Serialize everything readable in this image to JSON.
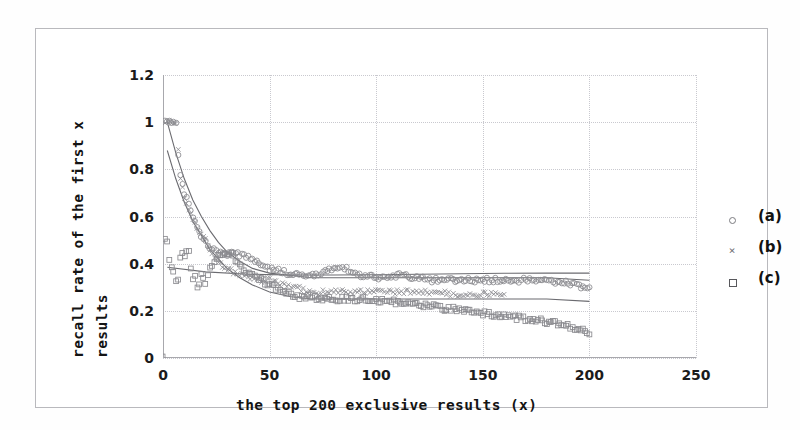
{
  "chart_data": {
    "type": "scatter",
    "title": "",
    "xlabel": "the top 200 exclusive results (x)",
    "ylabel_line1": "recall rate of the first x",
    "ylabel_line2": "results",
    "xlim": [
      0,
      250
    ],
    "ylim": [
      0,
      1.2
    ],
    "xticks": [
      "0",
      "50",
      "100",
      "150",
      "200",
      "250"
    ],
    "xtick_values": [
      0,
      50,
      100,
      150,
      200,
      250
    ],
    "yticks": [
      "0",
      "0.2",
      "0.4",
      "0.6",
      "0.8",
      "1",
      "1.2"
    ],
    "ytick_values": [
      0,
      0.2,
      0.4,
      0.6,
      0.8,
      1,
      1.2
    ],
    "grid": true,
    "grid_style": "dotted",
    "legend_position": "right-outside",
    "marker_color": "#8a8a8f",
    "fit_curve_color": "#6b6b70",
    "legend": [
      {
        "label": "(a)",
        "marker": "circle-marker"
      },
      {
        "label": "(b)",
        "marker": "cross-marker"
      },
      {
        "label": "(c)",
        "marker": "square-marker"
      }
    ],
    "series": [
      {
        "name": "(a)",
        "marker": "circle",
        "x": [
          1,
          2,
          3,
          4,
          5,
          6,
          7,
          8,
          9,
          10,
          12,
          14,
          16,
          18,
          20,
          22,
          24,
          26,
          28,
          30,
          32,
          34,
          36,
          38,
          40,
          42,
          44,
          46,
          48,
          50,
          54,
          58,
          62,
          66,
          70,
          74,
          78,
          82,
          86,
          90,
          94,
          98,
          102,
          106,
          110,
          114,
          118,
          122,
          126,
          130,
          134,
          138,
          142,
          146,
          150,
          154,
          158,
          162,
          166,
          170,
          174,
          178,
          182,
          186,
          190,
          194,
          198,
          200
        ],
        "y": [
          1.0,
          1.0,
          1.0,
          1.0,
          1.0,
          1.0,
          0.86,
          0.78,
          0.74,
          0.7,
          0.66,
          0.6,
          0.56,
          0.52,
          0.49,
          0.47,
          0.46,
          0.45,
          0.44,
          0.44,
          0.45,
          0.45,
          0.44,
          0.43,
          0.43,
          0.42,
          0.41,
          0.4,
          0.39,
          0.38,
          0.37,
          0.36,
          0.36,
          0.35,
          0.35,
          0.36,
          0.37,
          0.39,
          0.38,
          0.36,
          0.35,
          0.35,
          0.34,
          0.34,
          0.35,
          0.35,
          0.34,
          0.34,
          0.33,
          0.33,
          0.33,
          0.33,
          0.33,
          0.33,
          0.33,
          0.33,
          0.33,
          0.33,
          0.33,
          0.33,
          0.33,
          0.33,
          0.33,
          0.32,
          0.32,
          0.31,
          0.3,
          0.3
        ]
      },
      {
        "name": "(b)",
        "marker": "cross",
        "x": [
          1,
          2,
          3,
          4,
          5,
          6,
          8,
          10,
          12,
          14,
          16,
          18,
          20,
          22,
          24,
          26,
          28,
          30,
          34,
          38,
          42,
          46,
          50,
          54,
          58,
          62,
          66,
          70,
          74,
          78,
          82,
          86,
          90,
          94,
          98,
          102,
          106,
          110,
          114,
          118,
          122,
          126,
          130,
          134,
          138,
          142,
          146,
          150,
          154,
          158,
          160
        ],
        "y": [
          1.0,
          1.0,
          1.0,
          1.0,
          1.0,
          1.0,
          0.76,
          0.68,
          0.63,
          0.59,
          0.55,
          0.52,
          0.5,
          0.46,
          0.43,
          0.41,
          0.39,
          0.38,
          0.36,
          0.35,
          0.34,
          0.33,
          0.33,
          0.32,
          0.31,
          0.3,
          0.29,
          0.28,
          0.28,
          0.28,
          0.28,
          0.28,
          0.28,
          0.28,
          0.28,
          0.28,
          0.28,
          0.28,
          0.28,
          0.28,
          0.28,
          0.28,
          0.28,
          0.27,
          0.27,
          0.27,
          0.27,
          0.27,
          0.27,
          0.27,
          0.27
        ]
      },
      {
        "name": "(c)",
        "marker": "square",
        "x": [
          0,
          1,
          2,
          3,
          4,
          5,
          6,
          7,
          8,
          9,
          10,
          11,
          12,
          13,
          14,
          15,
          16,
          17,
          18,
          19,
          20,
          22,
          24,
          26,
          28,
          30,
          32,
          34,
          36,
          38,
          40,
          44,
          48,
          52,
          56,
          60,
          64,
          68,
          72,
          76,
          80,
          84,
          88,
          92,
          96,
          100,
          104,
          108,
          112,
          116,
          120,
          124,
          128,
          132,
          136,
          140,
          144,
          148,
          152,
          156,
          160,
          164,
          168,
          172,
          176,
          180,
          184,
          188,
          192,
          196,
          200
        ],
        "y": [
          0.0,
          0.5,
          0.5,
          0.42,
          0.38,
          0.37,
          0.33,
          0.33,
          0.42,
          0.44,
          0.43,
          0.45,
          0.46,
          0.38,
          0.34,
          0.35,
          0.3,
          0.31,
          0.36,
          0.34,
          0.32,
          0.38,
          0.41,
          0.43,
          0.44,
          0.45,
          0.44,
          0.42,
          0.4,
          0.38,
          0.36,
          0.34,
          0.32,
          0.3,
          0.28,
          0.27,
          0.26,
          0.26,
          0.25,
          0.25,
          0.25,
          0.25,
          0.25,
          0.25,
          0.25,
          0.24,
          0.24,
          0.24,
          0.23,
          0.23,
          0.23,
          0.22,
          0.22,
          0.21,
          0.21,
          0.2,
          0.2,
          0.19,
          0.19,
          0.18,
          0.18,
          0.17,
          0.17,
          0.16,
          0.16,
          0.15,
          0.15,
          0.14,
          0.13,
          0.12,
          0.1
        ]
      }
    ],
    "fit_curves": [
      {
        "name": "fit-a",
        "x": [
          2,
          6,
          10,
          14,
          18,
          22,
          26,
          30,
          36,
          42,
          50,
          60,
          70,
          85,
          100,
          120,
          140,
          160,
          180,
          200
        ],
        "y": [
          1.0,
          0.87,
          0.76,
          0.67,
          0.6,
          0.54,
          0.49,
          0.45,
          0.41,
          0.38,
          0.36,
          0.35,
          0.34,
          0.34,
          0.34,
          0.34,
          0.34,
          0.34,
          0.34,
          0.33
        ]
      },
      {
        "name": "fit-b",
        "x": [
          2,
          6,
          10,
          14,
          18,
          22,
          26,
          30,
          36,
          42,
          50,
          60,
          70,
          85,
          100,
          120,
          140,
          160,
          180,
          200
        ],
        "y": [
          0.88,
          0.76,
          0.66,
          0.58,
          0.52,
          0.46,
          0.42,
          0.38,
          0.34,
          0.31,
          0.28,
          0.26,
          0.25,
          0.25,
          0.25,
          0.25,
          0.25,
          0.25,
          0.25,
          0.24
        ]
      },
      {
        "name": "fit-c",
        "x": [
          2,
          20,
          40,
          60,
          80,
          100,
          120,
          140,
          160,
          180,
          200
        ],
        "y": [
          0.385,
          0.365,
          0.355,
          0.352,
          0.352,
          0.353,
          0.355,
          0.357,
          0.359,
          0.36,
          0.36
        ]
      }
    ]
  }
}
